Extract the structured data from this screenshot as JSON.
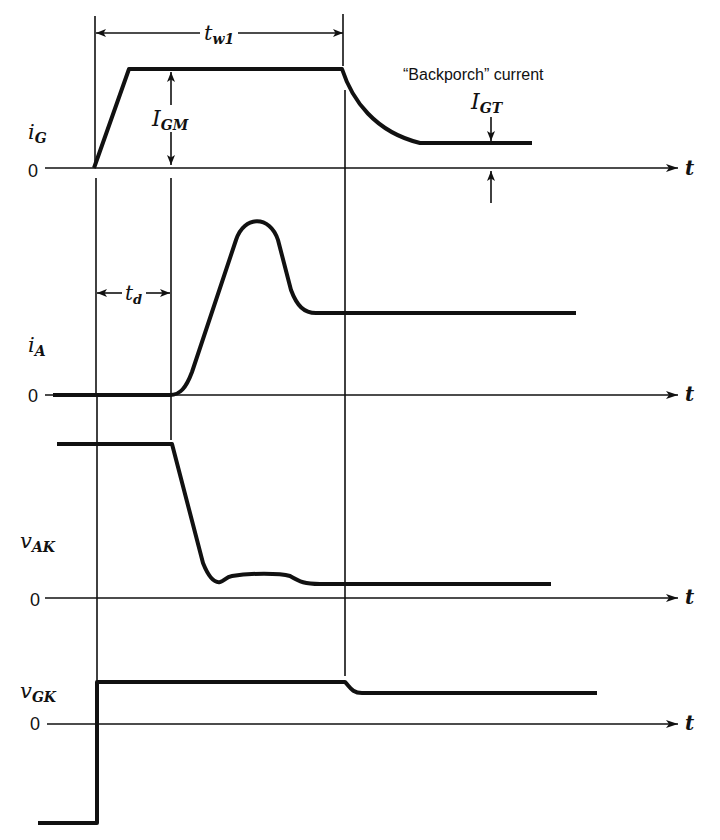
{
  "diagram": {
    "type": "timing-diagram",
    "colors": {
      "ink": "#111111",
      "background": "#ffffff"
    },
    "signals": [
      {
        "id": "iG",
        "label_main": "i",
        "label_sub": "G",
        "zero_label": "0",
        "axis_label": "t"
      },
      {
        "id": "iA",
        "label_main": "i",
        "label_sub": "A",
        "zero_label": "0",
        "axis_label": "t"
      },
      {
        "id": "vAK",
        "label_main": "v",
        "label_sub": "AK",
        "zero_label": "0",
        "axis_label": "t"
      },
      {
        "id": "vGK",
        "label_main": "v",
        "label_sub": "GK",
        "zero_label": "0",
        "axis_label": "t"
      }
    ],
    "annotations": {
      "tw1": {
        "main": "t",
        "sub": "w1"
      },
      "td": {
        "main": "t",
        "sub": "d"
      },
      "IGM": {
        "main": "I",
        "sub": "GM"
      },
      "IGT": {
        "main": "I",
        "sub": "GT"
      },
      "backporch": "“Backporch” current"
    }
  }
}
